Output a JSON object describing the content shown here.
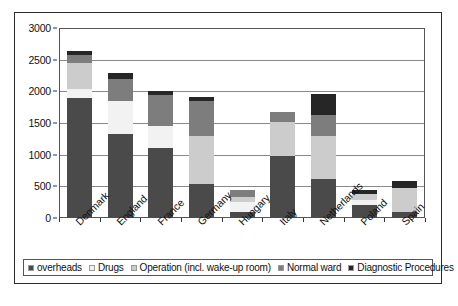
{
  "chart_data": {
    "type": "bar",
    "stacked": true,
    "title": "",
    "xlabel": "",
    "ylabel": "",
    "ylim": [
      0,
      3000
    ],
    "ytick_step": 500,
    "yticks": [
      0,
      500,
      1000,
      1500,
      2000,
      2500,
      3000
    ],
    "ytick_labels": [
      "0",
      "500",
      "1000",
      "1500",
      "2000",
      "2500",
      "3000"
    ],
    "grid": true,
    "legend_position": "bottom",
    "categories": [
      "Denmark",
      "England",
      "France",
      "Germany",
      "Hungary",
      "Italy",
      "Netherlands",
      "Poland",
      "Spain"
    ],
    "series": [
      {
        "name": "overheads",
        "color": "#4a4a4a",
        "values": [
          1890,
          1320,
          1100,
          530,
          100,
          980,
          620,
          200,
          100
        ]
      },
      {
        "name": "Drugs",
        "color": "#f2f2f2",
        "values": [
          140,
          530,
          350,
          0,
          150,
          0,
          0,
          80,
          0
        ]
      },
      {
        "name": "Operation (incl. wake-up room)",
        "color": "#cccccc",
        "values": [
          410,
          0,
          0,
          770,
          80,
          540,
          680,
          100,
          380
        ]
      },
      {
        "name": "Normal ward",
        "color": "#7d7d7d",
        "values": [
          130,
          350,
          500,
          550,
          120,
          150,
          320,
          0,
          0
        ]
      },
      {
        "name": "Diagnostic Procedures",
        "color": "#262626",
        "values": [
          60,
          90,
          50,
          60,
          0,
          0,
          340,
          70,
          100
        ]
      }
    ],
    "totals": [
      2630,
      2290,
      2000,
      1910,
      450,
      1670,
      1960,
      450,
      580
    ]
  },
  "legend": {
    "items": [
      {
        "label": "overheads",
        "color": "#4a4a4a"
      },
      {
        "label": "Drugs",
        "color": "#f2f2f2"
      },
      {
        "label": "Operation (incl. wake-up room)",
        "color": "#cccccc"
      },
      {
        "label": "Normal ward",
        "color": "#7d7d7d"
      },
      {
        "label": "Diagnostic Procedures",
        "color": "#262626"
      }
    ]
  },
  "caption": {
    "text": ""
  }
}
